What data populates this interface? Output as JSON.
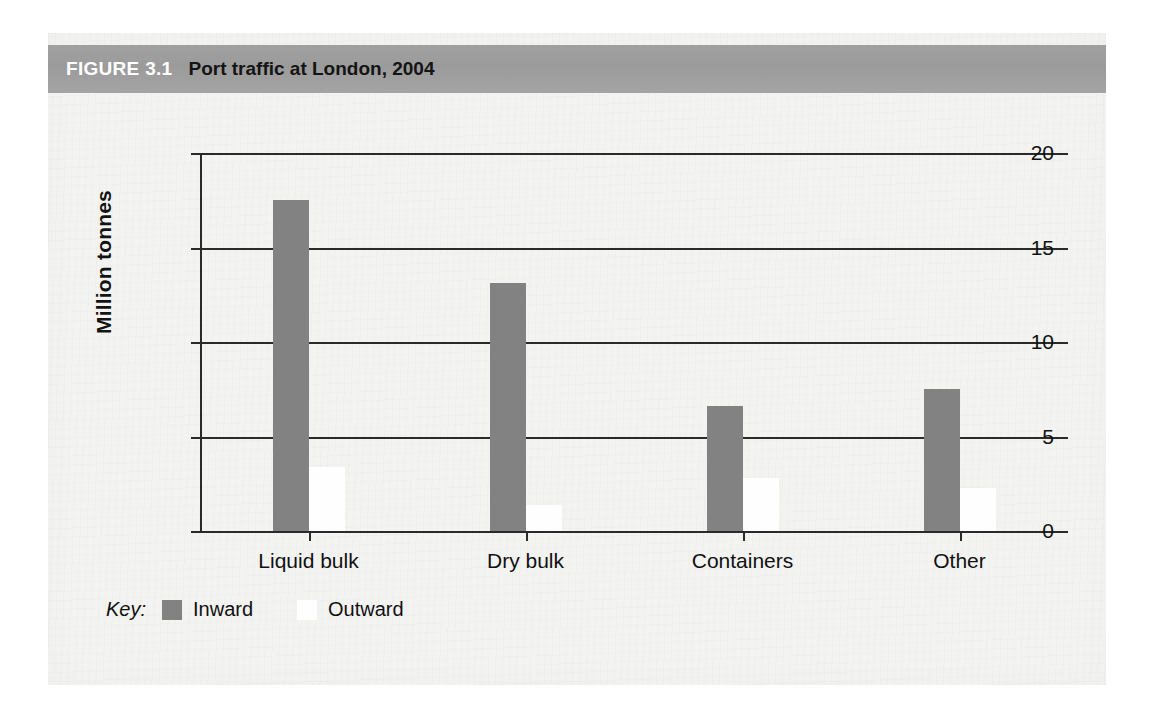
{
  "figure": {
    "number_label": "FIGURE 3.1",
    "title": "Port traffic at London, 2004"
  },
  "legend": {
    "key_label": "Key:",
    "items": [
      {
        "label": "Inward",
        "color": "#828282",
        "swatch": "inward-swatch"
      },
      {
        "label": "Outward",
        "color": "#fefefe",
        "swatch": "outward-swatch"
      }
    ]
  },
  "axis": {
    "y_title": "Million tonnes",
    "y_ticks": [
      "0",
      "5",
      "10",
      "15",
      "20"
    ]
  },
  "chart_data": {
    "type": "bar",
    "title": "Port traffic at London, 2004",
    "xlabel": "",
    "ylabel": "Million tonnes",
    "ylim": [
      0,
      20
    ],
    "yticks": [
      0,
      5,
      10,
      15,
      20
    ],
    "grid": true,
    "legend_position": "bottom-left",
    "categories": [
      "Liquid bulk",
      "Dry bulk",
      "Containers",
      "Other"
    ],
    "series": [
      {
        "name": "Inward",
        "color": "#828282",
        "values": [
          17.5,
          13.1,
          6.6,
          7.5
        ]
      },
      {
        "name": "Outward",
        "color": "#fefefe",
        "values": [
          3.4,
          1.4,
          2.8,
          2.3
        ]
      }
    ]
  }
}
